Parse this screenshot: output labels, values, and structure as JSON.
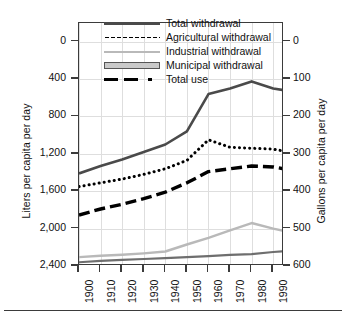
{
  "axes": {
    "left_title": "Liters per capita per day",
    "right_title": "Gallons per capita per day",
    "left_ticks": [
      "2,400",
      "2,000",
      "1,600",
      "1,200",
      "800",
      "400",
      "0"
    ],
    "right_ticks": [
      "600",
      "500",
      "400",
      "300",
      "200",
      "100",
      "0"
    ],
    "x_ticks": [
      "1900",
      "1910",
      "1920",
      "1930",
      "1940",
      "1950",
      "1960",
      "1970",
      "1980",
      "1990"
    ]
  },
  "legend": [
    {
      "label": "Total withdrawal",
      "key": "solid-dark"
    },
    {
      "label": "Agricultural withdrawal",
      "key": "dotted-black"
    },
    {
      "label": "Industrial withdrawal",
      "key": "solid-light-gray"
    },
    {
      "label": "Municipal withdrawal",
      "key": "filled-box-gray"
    },
    {
      "label": "Total use",
      "key": "dashed-black"
    }
  ],
  "colors": {
    "total_withdrawal": "#4a4a4a",
    "agricultural_withdrawal": "#000000",
    "industrial_withdrawal": "#b9b9b9",
    "municipal_withdrawal": "#6e6e6e",
    "total_use": "#000000",
    "frame": "#3b3b3b",
    "grid": "#dedede"
  },
  "chart_data": {
    "type": "line",
    "title": "",
    "xlabel": "",
    "ylabel": "Liters per capita per day",
    "y2label": "Gallons per capita per day",
    "xlim": [
      1900,
      1995
    ],
    "ylim": [
      0,
      2600
    ],
    "y2lim": [
      0,
      650
    ],
    "ytick_values": [
      0,
      400,
      800,
      1200,
      1600,
      2000,
      2400
    ],
    "y2tick_values": [
      0,
      100,
      200,
      300,
      400,
      500,
      600
    ],
    "grid": true,
    "legend_position": "top-center",
    "x": [
      1900,
      1910,
      1920,
      1930,
      1940,
      1950,
      1960,
      1970,
      1980,
      1990,
      1995
    ],
    "series": [
      {
        "name": "Total withdrawal",
        "values": [
          990,
          1070,
          1140,
          1220,
          1300,
          1440,
          1840,
          1900,
          1975,
          1900,
          1880
        ]
      },
      {
        "name": "Agricultural withdrawal",
        "values": [
          850,
          890,
          930,
          980,
          1040,
          1130,
          1350,
          1270,
          1260,
          1250,
          1230
        ]
      },
      {
        "name": "Industrial withdrawal",
        "values": [
          95,
          110,
          120,
          135,
          155,
          230,
          300,
          380,
          460,
          400,
          375
        ]
      },
      {
        "name": "Municipal withdrawal",
        "values": [
          40,
          55,
          65,
          75,
          85,
          95,
          105,
          118,
          128,
          150,
          158
        ]
      },
      {
        "name": "Total use",
        "values": [
          545,
          610,
          660,
          720,
          790,
          890,
          1010,
          1040,
          1070,
          1060,
          1040
        ]
      }
    ]
  }
}
